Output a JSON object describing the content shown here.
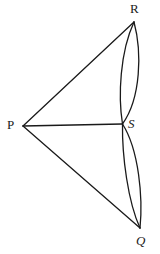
{
  "figure": {
    "kind": "geometry-diagram",
    "background_color": "#ffffff",
    "stroke_color": "#1a1a1a",
    "stroke_width": 1.3,
    "canvas": {
      "width": 160,
      "height": 254
    },
    "vertices": [
      {
        "id": "P",
        "label": "P",
        "style": "upright",
        "x": 23,
        "y": 126
      },
      {
        "id": "R",
        "label": "R",
        "style": "upright",
        "x": 134,
        "y": 22
      },
      {
        "id": "S",
        "label": "S",
        "style": "italic",
        "x": 122,
        "y": 124
      },
      {
        "id": "Q",
        "label": "Q",
        "style": "italic",
        "x": 140,
        "y": 228
      }
    ],
    "segments": [
      {
        "id": "PR",
        "from": "P",
        "to": "R",
        "type": "line"
      },
      {
        "id": "PS",
        "from": "P",
        "to": "S",
        "type": "line"
      },
      {
        "id": "PQ",
        "from": "P",
        "to": "Q",
        "type": "line"
      }
    ],
    "arcs": [
      {
        "id": "RS-outer",
        "from": "R",
        "to": "S",
        "bulge": "right",
        "type": "arc"
      },
      {
        "id": "RS-inner",
        "from": "R",
        "to": "S",
        "bulge": "left",
        "type": "arc"
      },
      {
        "id": "SQ-outer",
        "from": "S",
        "to": "Q",
        "bulge": "right",
        "type": "arc"
      },
      {
        "id": "SQ-inner",
        "from": "S",
        "to": "Q",
        "bulge": "left",
        "type": "arc"
      }
    ],
    "path_data": {
      "line_PR": "M 23 126 L 134 22",
      "line_PS": "M 23 126 L 122 124",
      "line_PQ": "M 23 126 L 140 228",
      "arc_RS_outer": "M 134 22 C 142 52 141 98 122.5 124",
      "arc_RS_inner": "M 134 22 C 120 52 118 96 122.5 124",
      "arc_SQ_outer": "M 122.5 124 C 139 150 143 198 140 228",
      "arc_SQ_inner": "M 122.5 124 C 122 156 128 202 140 228"
    }
  }
}
